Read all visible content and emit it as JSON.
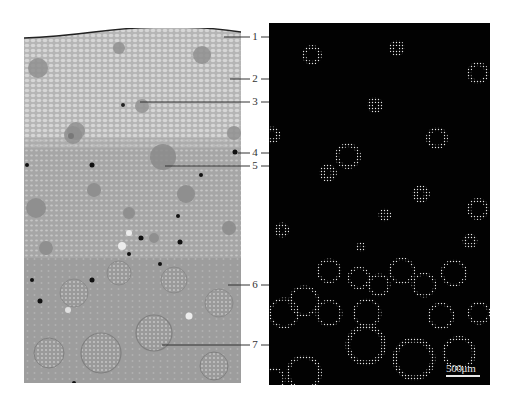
{
  "figure": {
    "left_panel": {
      "description": "light micrograph of stem cross-section (toluidine stained, grayscale)",
      "background": "#a9a9a9"
    },
    "right_panel": {
      "description": "fluorescence / dark-field image of same cross-section showing vascular bundles",
      "background": "#020202"
    },
    "labels": [
      {
        "id": "1",
        "text": "1",
        "y": 12
      },
      {
        "id": "2",
        "text": "2",
        "y": 53
      },
      {
        "id": "3",
        "text": "3",
        "y": 76
      },
      {
        "id": "4",
        "text": "4",
        "y": 125
      },
      {
        "id": "5",
        "text": "5",
        "y": 138
      },
      {
        "id": "6",
        "text": "6",
        "y": 258
      },
      {
        "id": "7",
        "text": "7",
        "y": 318
      }
    ],
    "scale_bar": {
      "text": "500μm"
    },
    "colors": {
      "leader_line": "#333333",
      "right_leader_line": "#dddddd"
    }
  }
}
